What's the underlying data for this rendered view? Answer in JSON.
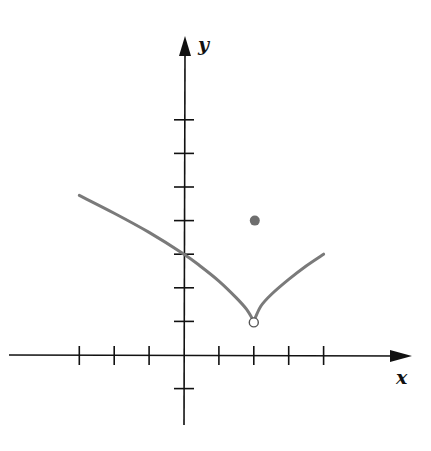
{
  "chart_data": {
    "type": "line",
    "title": "",
    "xlabel": "x",
    "ylabel": "y",
    "xlim": [
      -5.2,
      6.5
    ],
    "ylim": [
      -2.1,
      9.5
    ],
    "x_ticks": [
      -3,
      -2,
      -1,
      1,
      2,
      3,
      4
    ],
    "y_ticks": [
      -1,
      1,
      2,
      3,
      4,
      5,
      6,
      7
    ],
    "tick_labels_shown": false,
    "grid": false,
    "legend": null,
    "series": [
      {
        "name": "f(x) left branch",
        "points": [
          [
            -3,
            4.75
          ],
          [
            -2,
            4.22
          ],
          [
            -1,
            3.65
          ],
          [
            0,
            3.0
          ],
          [
            0.5,
            2.62
          ],
          [
            1,
            2.2
          ],
          [
            1.5,
            1.7
          ],
          [
            1.8,
            1.35
          ],
          [
            2,
            1.0
          ]
        ],
        "end_open": true
      },
      {
        "name": "f(x) right branch",
        "points": [
          [
            2,
            1.0
          ],
          [
            2.2,
            1.45
          ],
          [
            2.5,
            1.8
          ],
          [
            3,
            2.25
          ],
          [
            3.5,
            2.65
          ],
          [
            4,
            3.0
          ]
        ],
        "start_open": true
      }
    ],
    "markers": [
      {
        "type": "open-circle",
        "x": 2,
        "y": 1,
        "label": "hole"
      },
      {
        "type": "filled-circle",
        "x": 2,
        "y": 4,
        "label": "f(2)"
      }
    ],
    "colors": {
      "axes": "#111111",
      "curve": "#7a7a7a",
      "point": "#6e6e6e"
    }
  }
}
